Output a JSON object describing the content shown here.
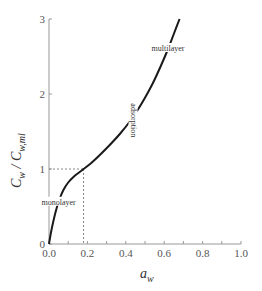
{
  "chart_data": {
    "type": "line",
    "title": "",
    "xlabel": "a",
    "xlabel_sub": "w",
    "ylabel": "C",
    "ylabel_sub": "w",
    "ylabel_sep": " / C",
    "ylabel_sub2": "w,ml",
    "xlim": [
      0,
      1.0
    ],
    "ylim": [
      0,
      3
    ],
    "xticks": [
      "0.0",
      "0.2",
      "0.4",
      "0.6",
      "0.8",
      "1.0"
    ],
    "xtick_values": [
      0.0,
      0.2,
      0.4,
      0.6,
      0.8,
      1.0
    ],
    "xminor_step": 0.1,
    "yticks": [
      "0",
      "1",
      "2",
      "3"
    ],
    "ytick_values": [
      0,
      1,
      2,
      3
    ],
    "grid": false,
    "series": [
      {
        "name": "sorption isotherm",
        "color": "#1a1a1a",
        "x": [
          0.0,
          0.01,
          0.025,
          0.04,
          0.055,
          0.075,
          0.1,
          0.13,
          0.16,
          0.18,
          0.22,
          0.27,
          0.32,
          0.37,
          0.42,
          0.46,
          0.5,
          0.54,
          0.58,
          0.62,
          0.65,
          0.68
        ],
        "y": [
          0.0,
          0.15,
          0.33,
          0.48,
          0.6,
          0.72,
          0.82,
          0.9,
          0.96,
          1.0,
          1.08,
          1.2,
          1.33,
          1.47,
          1.63,
          1.78,
          1.95,
          2.14,
          2.36,
          2.6,
          2.8,
          3.0
        ]
      }
    ],
    "reference_lines": {
      "x": 0.18,
      "y": 1.0,
      "style": "dotted",
      "color": "#888888"
    },
    "annotations": [
      {
        "text": "monolayer",
        "x": 0.05,
        "y": 0.55,
        "rotation": "horizontal"
      },
      {
        "text": "adsorption",
        "x": 0.43,
        "y": 1.65,
        "rotation": "vertical"
      },
      {
        "text": "multilayer",
        "x": 0.62,
        "y": 2.6,
        "rotation": "horizontal"
      }
    ]
  }
}
